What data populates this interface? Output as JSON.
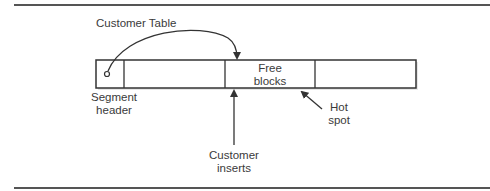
{
  "diagram": {
    "type": "segment-free-list-hotspot",
    "labels": {
      "customer_table": "Customer Table",
      "segment_header_line1": "Segment",
      "segment_header_line2": "header",
      "free_blocks_line1": "Free",
      "free_blocks_line2": "blocks",
      "hot_spot_line1": "Hot",
      "hot_spot_line2": "spot",
      "customer_inserts_line1": "Customer",
      "customer_inserts_line2": "inserts"
    },
    "segment_cells": [
      "segment-header",
      "block",
      "free-blocks",
      "block"
    ],
    "colors": {
      "line": "#333333",
      "rule": "#555555",
      "background": "#ffffff"
    }
  }
}
